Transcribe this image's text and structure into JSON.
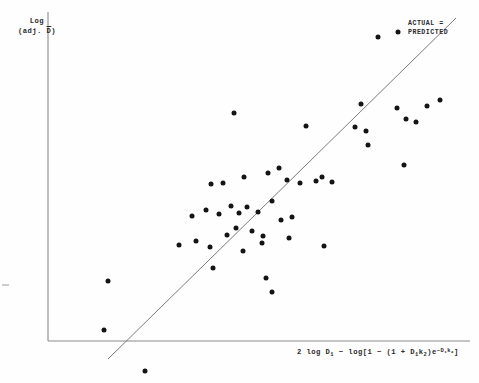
{
  "figure": {
    "background_color": "#fefefe",
    "point_color": "#141414",
    "axis_color": "#8a8a8a",
    "line_color": "#6d6d6d"
  },
  "labels": {
    "y_axis_line1": "Log",
    "y_axis_line2_prefix": "(adj. ",
    "y_axis_line2_var": "D",
    "y_axis_line2_suffix": ")",
    "x_axis_full": "2 log D1 - log[1 - (1 + D1k2)e-D1k2]",
    "legend_line1": "ACTUAL =",
    "legend_line2": "PREDICTED"
  },
  "chart_data": {
    "type": "scatter",
    "title": "",
    "xlabel": "2 log D1 - log[1 - (1 + D1k2)e^-D1k2]",
    "ylabel": "Log (adj. D-bar)",
    "grid": false,
    "legend_position": "top-right",
    "annotations": [
      {
        "text": "ACTUAL = PREDICTED",
        "x": 420,
        "y": 24,
        "refers_to": "identity-line"
      }
    ],
    "axes_pixel_frame": {
      "x_axis_y": 341,
      "y_axis_x": 48,
      "x_axis_x_start": 48,
      "x_axis_x_end": 470,
      "y_axis_y_top": 12,
      "y_axis_y_bottom": 341
    },
    "identity_line_pixels": {
      "x1": 108,
      "y1": 359,
      "x2": 456,
      "y2": 18
    },
    "series": [
      {
        "name": "observations",
        "marker": "filled-circle",
        "points_pixels": [
          [
            378,
            37
          ],
          [
            398,
            32
          ],
          [
            234,
            113
          ],
          [
            306,
            126
          ],
          [
            361,
            104
          ],
          [
            397,
            108
          ],
          [
            427,
            106
          ],
          [
            406,
            119
          ],
          [
            416,
            122
          ],
          [
            440,
            100
          ],
          [
            355,
            127
          ],
          [
            366,
            131
          ],
          [
            404,
            165
          ],
          [
            368,
            145
          ],
          [
            211,
            184
          ],
          [
            223,
            183
          ],
          [
            244,
            177
          ],
          [
            268,
            173
          ],
          [
            279,
            168
          ],
          [
            287,
            180
          ],
          [
            300,
            183
          ],
          [
            316,
            181
          ],
          [
            322,
            177
          ],
          [
            332,
            182
          ],
          [
            192,
            216
          ],
          [
            206,
            210
          ],
          [
            219,
            214
          ],
          [
            231,
            206
          ],
          [
            239,
            213
          ],
          [
            247,
            207
          ],
          [
            258,
            212
          ],
          [
            272,
            201
          ],
          [
            281,
            220
          ],
          [
            292,
            217
          ],
          [
            236,
            228
          ],
          [
            252,
            231
          ],
          [
            263,
            236
          ],
          [
            179,
            245
          ],
          [
            196,
            241
          ],
          [
            210,
            247
          ],
          [
            227,
            235
          ],
          [
            243,
            251
          ],
          [
            262,
            243
          ],
          [
            289,
            238
          ],
          [
            324,
            246
          ],
          [
            213,
            268
          ],
          [
            266,
            278
          ],
          [
            272,
            292
          ],
          [
            108,
            281
          ],
          [
            104,
            330
          ],
          [
            145,
            371
          ]
        ]
      }
    ]
  }
}
